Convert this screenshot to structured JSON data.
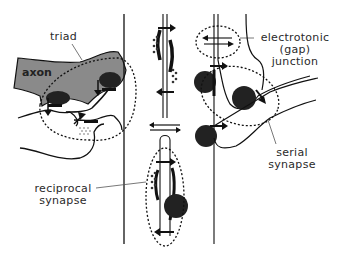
{
  "diagram": {
    "type": "neuron synapse schematic",
    "colors": {
      "axon_fill": "#8a8a8a",
      "line": "#111111",
      "vesicle_fill": "#222222",
      "background": "#ffffff"
    },
    "labels": {
      "triad": "triad",
      "axon": "axon",
      "gap_junction_line1": "electrotonic",
      "gap_junction_line2": "(gap)",
      "gap_junction_line3": "junction",
      "reciprocal_line1": "reciprocal",
      "reciprocal_line2": "synapse",
      "serial_line1": "serial",
      "serial_line2": "synapse"
    },
    "regions": [
      {
        "name": "triad",
        "position": "upper-left"
      },
      {
        "name": "reciprocal synapse",
        "position": "center-lower"
      },
      {
        "name": "electrotonic gap junction",
        "position": "upper-right"
      },
      {
        "name": "serial synapse",
        "position": "right"
      }
    ]
  }
}
